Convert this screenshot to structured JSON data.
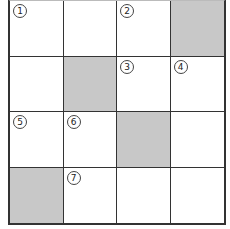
{
  "puzzle": {
    "rows": 4,
    "cols": 4,
    "shaded_color": "#c8c8c8",
    "cells": [
      [
        {
          "num": "1",
          "shaded": false
        },
        {
          "num": "",
          "shaded": false
        },
        {
          "num": "2",
          "shaded": false
        },
        {
          "num": "",
          "shaded": true
        }
      ],
      [
        {
          "num": "",
          "shaded": false
        },
        {
          "num": "",
          "shaded": true
        },
        {
          "num": "3",
          "shaded": false
        },
        {
          "num": "4",
          "shaded": false
        }
      ],
      [
        {
          "num": "5",
          "shaded": false
        },
        {
          "num": "6",
          "shaded": false
        },
        {
          "num": "",
          "shaded": true
        },
        {
          "num": "",
          "shaded": false
        }
      ],
      [
        {
          "num": "",
          "shaded": true
        },
        {
          "num": "7",
          "shaded": false
        },
        {
          "num": "",
          "shaded": false
        },
        {
          "num": "",
          "shaded": false
        }
      ]
    ]
  }
}
